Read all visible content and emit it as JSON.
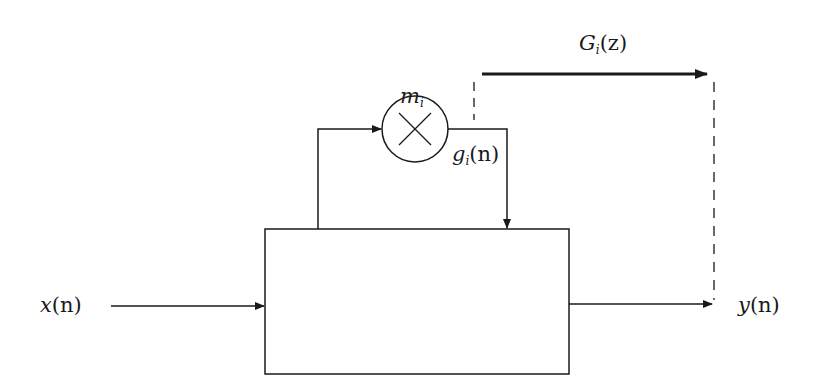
{
  "diagram": {
    "type": "block-diagram",
    "colors": {
      "stroke": "#1a1a1a",
      "background": "#ffffff"
    },
    "labels": {
      "input": {
        "base": "x",
        "arg": "(n)"
      },
      "output": {
        "base": "y",
        "arg": "(n)"
      },
      "multiplier_gain": {
        "base": "m",
        "sub": "i"
      },
      "branch_signal": {
        "base": "g",
        "sub": "i",
        "arg": "(n)"
      },
      "transfer_function": {
        "base": "G",
        "sub": "i",
        "arg": "(z)"
      }
    },
    "nodes": [
      {
        "id": "main-block",
        "kind": "rectangle",
        "label": ""
      },
      {
        "id": "multiplier",
        "kind": "circle-cross",
        "label": "m_i"
      }
    ],
    "edges": [
      {
        "from": "x(n)",
        "to": "main-block",
        "style": "solid"
      },
      {
        "from": "main-block",
        "to": "multiplier",
        "style": "solid"
      },
      {
        "from": "multiplier",
        "to": "main-block",
        "style": "solid",
        "label": "g_i(n)"
      },
      {
        "from": "main-block",
        "to": "y(n)",
        "style": "solid"
      },
      {
        "from": "g_i(n) tap",
        "to": "y(n)",
        "style": "dashed-bracket",
        "label": "G_i(z)"
      }
    ]
  }
}
